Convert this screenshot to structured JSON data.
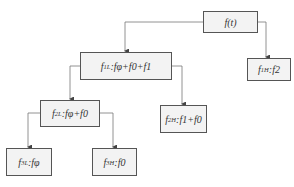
{
  "diagram": {
    "type": "tree",
    "nodes": [
      {
        "id": "root",
        "label": "f(t)"
      },
      {
        "id": "f1L",
        "label": "f1L:fφ+f0+f1",
        "parent": "root"
      },
      {
        "id": "f1H",
        "label": "f1H:f2",
        "parent": "root"
      },
      {
        "id": "f2L",
        "label": "f2L:fφ+f0",
        "parent": "f1L"
      },
      {
        "id": "f2H",
        "label": "f2H:f1+f0",
        "parent": "f1L"
      },
      {
        "id": "f3L",
        "label": "f3L:fφ",
        "parent": "f2L"
      },
      {
        "id": "f3H",
        "label": "f3H:f0",
        "parent": "f2L"
      }
    ],
    "labels": {
      "root": {
        "main": "f(t)"
      },
      "f1L": {
        "f": "f",
        "sub": "1L",
        "rest": ":fφ+f0+f1"
      },
      "f1H": {
        "f": "f",
        "sub": "1H",
        "rest": ":f2"
      },
      "f2L": {
        "f": "f",
        "sub": "2L",
        "rest": ":fφ+f0"
      },
      "f2H": {
        "f": "f",
        "sub": "2H",
        "rest": ":f1+f0"
      },
      "f3L": {
        "f": "f",
        "sub": "3L",
        "rest": ":fφ"
      },
      "f3H": {
        "f": "f",
        "sub": "3H",
        "rest": ":f0"
      }
    }
  },
  "colors": {
    "box_fill": "#f3f3f3",
    "box_border": "#555555",
    "line": "#777777"
  }
}
